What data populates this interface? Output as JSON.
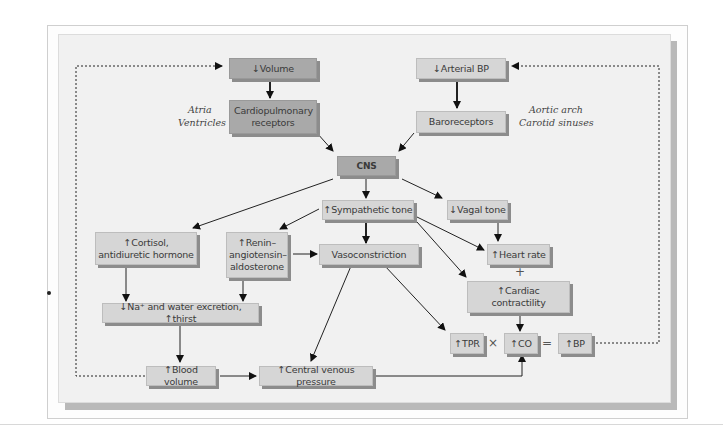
{
  "diagram": {
    "nodes": {
      "volume": "↓Volume",
      "arterial_bp": "↓Arterial BP",
      "cardiopulmonary": "Cardiopulmonary receptors",
      "baroreceptors": "Baroreceptors",
      "cns": "CNS",
      "sympathetic": "↑Sympathetic tone",
      "vagal": "↓Vagal tone",
      "cortisol": "↑Cortisol, antidiuretic hormone",
      "renin": "↑Renin– angiotensin– aldosterone",
      "vasoconstriction": "Vasoconstriction",
      "heart_rate": "↑Heart rate",
      "contractility": "↑Cardiac contractility",
      "na_water": "↓Na⁺ and water excretion, ↑thirst",
      "tpr": "↑TPR",
      "co": "↑CO",
      "bp": "↑BP",
      "blood_volume": "↑Blood volume",
      "cvp": "↑Central venous pressure"
    },
    "labels": {
      "atria": "Atria",
      "ventricles": "Ventricles",
      "aortic_arch": "Aortic arch",
      "carotid_sinuses": "Carotid sinuses"
    },
    "operators": {
      "plus": "+",
      "times": "×",
      "equals": "="
    }
  }
}
